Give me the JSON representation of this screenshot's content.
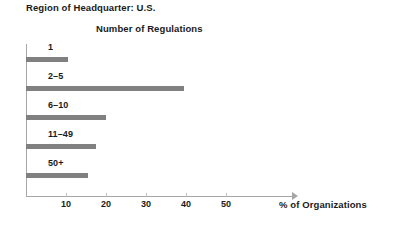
{
  "header": {
    "region_title": "Region of Headquarter: U.S."
  },
  "chart_data": {
    "type": "bar",
    "orientation": "horizontal",
    "title": "Number of Regulations",
    "xlabel": "% of Organizations",
    "ylabel": "",
    "categories": [
      "1",
      "2–5",
      "6–10",
      "11–49",
      "50+"
    ],
    "values": [
      10.5,
      39.5,
      20,
      17.5,
      15.5
    ],
    "xticks": [
      "10",
      "20",
      "30",
      "40",
      "50"
    ],
    "xtick_values": [
      10,
      20,
      30,
      40,
      50
    ],
    "xlim": [
      0,
      66.75
    ],
    "grid": false,
    "legend": false,
    "bar_color": "#808080",
    "axis_color": "#a6a6a6"
  }
}
